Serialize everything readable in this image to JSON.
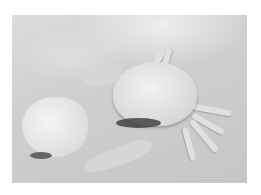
{
  "image": {
    "subject": "crab on sand beside a moulted shell",
    "style": "grayscale photograph with white border",
    "colors": {
      "border": "#ffffff",
      "sand": "#cfcfcf",
      "shell": "#e6e6e6",
      "shadow": "#3a3a3a"
    }
  }
}
